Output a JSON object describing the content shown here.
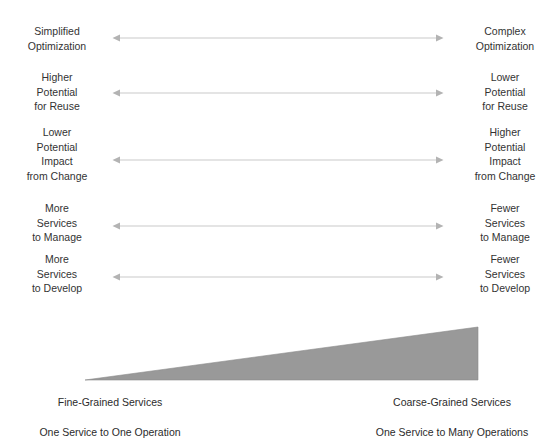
{
  "colors": {
    "background": "#ffffff",
    "text": "#333333",
    "axis_text": "#2b2b2b",
    "arrow_line": "#c9c9c9",
    "arrow_head": "#b3b3b3",
    "wedge_fill": "#999999",
    "wedge_stroke": "#8a8a8a"
  },
  "diagram": {
    "type": "tradeoff-spectrum",
    "title": "",
    "orientation": "horizontal",
    "axis": {
      "left_endpoint": {
        "line1": "Fine-Grained Services",
        "line2": "One Service to One Operation"
      },
      "right_endpoint": {
        "line1": "Coarse-Grained Services",
        "line2": "One Service to Many Operations"
      },
      "wedge": {
        "shape": "right-triangle",
        "description": "service granularity increases left to right",
        "tip_side": "left",
        "thick_side": "right"
      }
    },
    "rows": [
      {
        "id": "optimization",
        "left_label": "Simplified\nOptimization",
        "right_label": "Complex\nOptimization",
        "arrow": "double-headed"
      },
      {
        "id": "reuse-potential",
        "left_label": "Higher\nPotential\nfor Reuse",
        "right_label": "Lower\nPotential\nfor Reuse",
        "arrow": "double-headed"
      },
      {
        "id": "impact-from-change",
        "left_label": "Lower\nPotential\nImpact\nfrom Change",
        "right_label": "Higher\nPotential\nImpact\nfrom Change",
        "arrow": "double-headed"
      },
      {
        "id": "services-to-manage",
        "left_label": "More\nServices\nto Manage",
        "right_label": "Fewer\nServices\nto Manage",
        "arrow": "double-headed"
      },
      {
        "id": "services-to-develop",
        "left_label": "More\nServices\nto Develop",
        "right_label": "Fewer\nServices\nto Develop",
        "arrow": "double-headed"
      }
    ]
  }
}
